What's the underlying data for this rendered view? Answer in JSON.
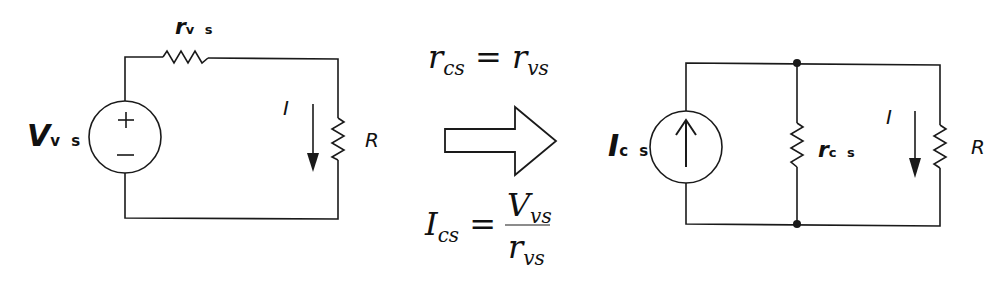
{
  "left_circuit": {
    "title": "Voltage source model",
    "source_label": {
      "main": "V",
      "sub": "v s"
    },
    "series_resistor_label": {
      "main": "r",
      "sub": "v s"
    },
    "current_label": "I",
    "load_label": "R",
    "source_polarity": {
      "plus": "+",
      "minus": "−"
    }
  },
  "transform": {
    "equation_top": {
      "lhs": "r",
      "lhs_sub": "cs",
      "eq": "=",
      "rhs": "r",
      "rhs_sub": "vs"
    },
    "equation_bottom": {
      "lhs": "I",
      "lhs_sub": "cs",
      "eq": "=",
      "num": "V",
      "num_sub": "vs",
      "den": "r",
      "den_sub": "vs"
    }
  },
  "right_circuit": {
    "title": "Current source model",
    "source_label": {
      "main": "I",
      "sub": "c s"
    },
    "shunt_resistor_label": {
      "main": "r",
      "sub": "c s"
    },
    "current_label": "I",
    "load_label": "R"
  },
  "colors": {
    "line": "#1a1a1a",
    "background": "#ffffff"
  }
}
